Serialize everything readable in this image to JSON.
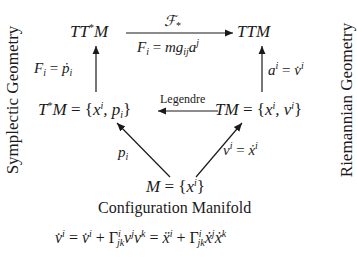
{
  "nodes": {
    "ttstar_m": "TT*M",
    "ttm": "TTM",
    "tstar_m": "T*M = {x^i, p_i}",
    "tm": "TM = {x^i, v^i}",
    "m": "M = {x^i}"
  },
  "edges": {
    "top_above": "F_*",
    "top_below": "F_i = m g_ij a^j",
    "left_vertical": "F_i = ṗ_i",
    "right_vertical": "a^i = v̇^i",
    "middle": "Legendre",
    "bottom_left": "p_i",
    "bottom_right": "v^i = ẋ^i"
  },
  "captions": {
    "configuration": "Configuration Manifold",
    "left_side": "Symplectic Geometry",
    "right_side": "Riemannian Geometry",
    "equation": "v̇^i = v̇^i + Γ^i_jk v^j v^k = ẍ^i + Γ^i_jk ẋ^j ẋ^k"
  }
}
